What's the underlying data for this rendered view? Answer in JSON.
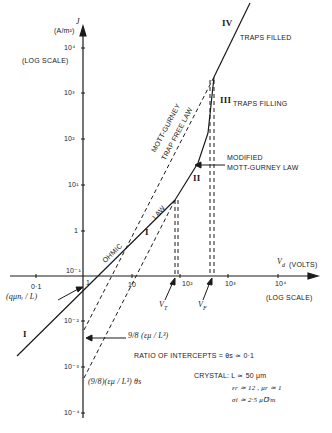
{
  "y_axis": {
    "label": "J",
    "unit": "(A/m²)",
    "scale_note": "(LOG SCALE)",
    "ticks": [
      "10⁴",
      "10³",
      "10²",
      "10¹",
      "1",
      "10⁻¹",
      "10⁻²",
      "10⁻³",
      "10⁻⁴"
    ]
  },
  "x_axis": {
    "label": "V",
    "label_sub": "d",
    "unit": "(VOLTS)",
    "scale_note": "(LOG SCALE)",
    "ticks": [
      "0·1",
      "1",
      "10",
      "10²",
      "10³",
      "10⁴"
    ],
    "markers": {
      "vt": "V",
      "vt_sub": "T",
      "vf": "V",
      "vf_sub": "F"
    }
  },
  "regions": {
    "i_upper": "I",
    "i_lower": "I",
    "ii": "II",
    "iii": "III",
    "iv": "IV"
  },
  "labels": {
    "ohmic": "OHMIC",
    "law": "LAW",
    "mott_gurney_1": "MOTT-GURNEY",
    "mott_gurney_2": "TRAP FREE LAW",
    "traps_filled": "TRAPS FILLED",
    "traps_filling": "TRAPS FILLING",
    "modified_1": "MODIFIED",
    "modified_2": "MOTT-GURNEY LAW",
    "ohmic_intercept": "(qμnᵢ / L)",
    "tf_intercept": "9/8 (εμ / L³)",
    "trap_intercept": "(9/8)(εμ / L³) θs",
    "ratio": "RATIO OF INTERCEPTS = θs ≃ 0·1"
  },
  "crystal": {
    "line1": "CRYSTAL: L ≃ 50 μm",
    "line2": "εr ≃ 12 , μr ≃ 1",
    "line3": "σi ≃ 2·5 μ℧/m"
  }
}
